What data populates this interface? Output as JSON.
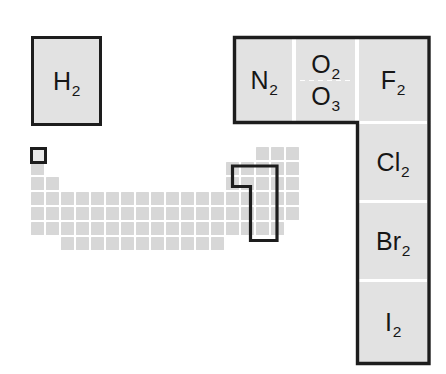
{
  "diagram": {
    "colors": {
      "cell_fill": "#e2e2e2",
      "ghost_fill": "#d7d7d7",
      "outline": "#1d1d1d",
      "background": "#ffffff",
      "text": "#161616"
    }
  },
  "hydrogen_box": {
    "name": "hydrogen",
    "element": "H",
    "subscript": "2",
    "label": "H2"
  },
  "lithium_marker": {
    "name": "small-outlined-cell",
    "label": ""
  },
  "top_block": {
    "cells": [
      {
        "name": "nitrogen",
        "element": "N",
        "subscript": "2",
        "label": "N2"
      },
      {
        "name": "oxygen",
        "stacked": true,
        "entries": [
          {
            "element": "O",
            "subscript": "2",
            "label": "O2"
          },
          {
            "element": "O",
            "subscript": "3",
            "label": "O3"
          }
        ]
      },
      {
        "name": "fluorine",
        "element": "F",
        "subscript": "2",
        "label": "F2"
      }
    ]
  },
  "halogen_column": {
    "cells": [
      {
        "name": "chlorine",
        "element": "Cl",
        "subscript": "2",
        "label": "Cl2"
      },
      {
        "name": "bromine",
        "element": "Br",
        "subscript": "2",
        "label": "Br2"
      },
      {
        "name": "iodine",
        "element": "I",
        "subscript": "2",
        "label": "I2"
      }
    ]
  },
  "metalloid_outline": {
    "name": "metalloid-staircase-outline",
    "shape": "staircase",
    "points": "232,166 277,166 277,240 250,240 250,186 232,186"
  },
  "ghost_grid": {
    "description": "faint unlabeled periodic table cells",
    "cell_size": 13,
    "pitch": 15,
    "groups": [
      {
        "name": "s-block-column",
        "x": 31,
        "y": 162,
        "cols": 1,
        "rows": 5
      },
      {
        "name": "s-block-column-2",
        "x": 46,
        "y": 177,
        "cols": 1,
        "rows": 4
      },
      {
        "name": "d-block",
        "x": 61,
        "y": 192,
        "cols": 10,
        "rows": 4
      },
      {
        "name": "p-block-left",
        "x": 211,
        "y": 192,
        "cols": 1,
        "rows": 4
      },
      {
        "name": "p-block-mid",
        "x": 226,
        "y": 162,
        "cols": 2,
        "rows": 5
      },
      {
        "name": "p-block-right",
        "x": 256,
        "y": 147,
        "cols": 2,
        "rows": 6
      },
      {
        "name": "p-block-far",
        "x": 286,
        "y": 147,
        "cols": 1,
        "rows": 5
      }
    ]
  }
}
